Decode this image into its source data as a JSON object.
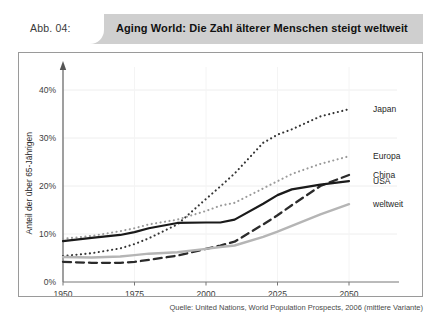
{
  "header": {
    "figure_label": "Abb. 04:",
    "title": "Aging World: Die Zahl älterer Menschen steigt weltweit",
    "bar_color": "#cfcfcf",
    "tab_color": "#ffffff"
  },
  "source": {
    "text": "Quelle: United Nations, World Population Prospects, 2006 (mittlere Variante)"
  },
  "chart_data": {
    "type": "line",
    "title": "Aging World: Die Zahl älterer Menschen steigt weltweit",
    "subtitle": "",
    "xlabel": "",
    "ylabel": "Anteil der über 65-Jährigen",
    "xlim": [
      1950,
      2050
    ],
    "ylim": [
      0,
      45
    ],
    "xticks": [
      1950,
      1975,
      2000,
      2025,
      2050
    ],
    "xtick_labels": [
      "1950",
      "1975",
      "2000",
      "2025",
      "2050"
    ],
    "yticks": [
      0,
      10,
      20,
      30,
      40
    ],
    "ytick_labels": [
      "0%",
      "10%",
      "20%",
      "30%",
      "40%"
    ],
    "grid": true,
    "legend_position": "right",
    "x": [
      1950,
      1960,
      1970,
      1975,
      1980,
      1990,
      2000,
      2005,
      2010,
      2020,
      2025,
      2030,
      2040,
      2050
    ],
    "series": [
      {
        "name": "Japan",
        "color": "#333333",
        "style": "dotted",
        "width": 2.1,
        "label_y_percent": 36.0,
        "values": [
          5.4,
          6.0,
          7.0,
          7.9,
          9.1,
          12.0,
          17.3,
          19.9,
          22.6,
          29.0,
          30.7,
          31.8,
          34.5,
          36.0
        ]
      },
      {
        "name": "Europa",
        "color": "#9a9a9a",
        "style": "dotted",
        "width": 2.1,
        "label_y_percent": 26.2,
        "values": [
          9.0,
          9.6,
          10.6,
          11.2,
          12.0,
          13.0,
          14.8,
          15.9,
          16.5,
          19.5,
          21.0,
          22.5,
          24.6,
          26.2
        ]
      },
      {
        "name": "China",
        "color": "#2b2b2b",
        "style": "dashed",
        "width": 2.3,
        "label_y_percent": 22.3,
        "values": [
          4.2,
          4.0,
          4.0,
          4.2,
          4.6,
          5.5,
          6.9,
          7.6,
          8.4,
          12.0,
          13.9,
          16.0,
          20.0,
          22.3
        ]
      },
      {
        "name": "USA",
        "color": "#1a1a1a",
        "style": "solid",
        "width": 2.2,
        "label_y_percent": 21.0,
        "values": [
          8.5,
          9.2,
          9.8,
          10.4,
          11.2,
          12.3,
          12.4,
          12.4,
          13.0,
          16.3,
          18.1,
          19.3,
          20.3,
          21.0
        ]
      },
      {
        "name": "weltweit",
        "color": "#b5b5b5",
        "style": "solid",
        "width": 2.4,
        "label_y_percent": 16.2,
        "values": [
          5.2,
          5.1,
          5.3,
          5.6,
          5.9,
          6.2,
          6.9,
          7.3,
          7.6,
          9.4,
          10.5,
          11.7,
          14.1,
          16.2
        ]
      }
    ]
  }
}
